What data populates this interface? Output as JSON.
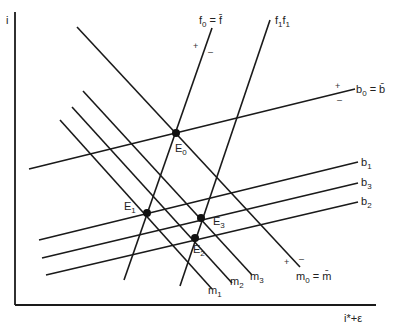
{
  "diagram": {
    "axes": {
      "y_label": "i",
      "x_label": "i*+ε"
    },
    "curves": {
      "f0": {
        "name": "f",
        "sub": "0",
        "suffix": " = f̄",
        "plus": "+",
        "minus": "–"
      },
      "f1": {
        "label_a": "f",
        "sub_a": "1",
        "label_b": "f",
        "sub_b": "1"
      },
      "b0": {
        "name": "b",
        "sub": "0",
        "suffix": " = b̄",
        "plus": "+",
        "minus": "–"
      },
      "b1": {
        "name": "b",
        "sub": "1"
      },
      "b2": {
        "name": "b",
        "sub": "2"
      },
      "b3": {
        "name": "b",
        "sub": "3"
      },
      "m0": {
        "name": "m",
        "sub": "0",
        "suffix": " = m̄",
        "plus": "+",
        "minus": "–"
      },
      "m1": {
        "name": "m",
        "sub": "1"
      },
      "m2": {
        "name": "m",
        "sub": "2"
      },
      "m3": {
        "name": "m",
        "sub": "3"
      }
    },
    "equilibria": [
      {
        "name": "E",
        "sub": "0"
      },
      {
        "name": "E",
        "sub": "1"
      },
      {
        "name": "E",
        "sub": "2"
      },
      {
        "name": "E",
        "sub": "3"
      }
    ]
  }
}
